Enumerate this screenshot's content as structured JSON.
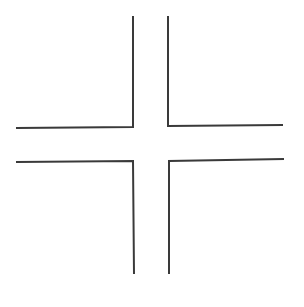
{
  "diagram": {
    "stroke_color": "#3a3a3a",
    "background": "#ffffff",
    "corners": [
      {
        "name": "top-left",
        "points": "133,16 133,127 16,128"
      },
      {
        "name": "top-right",
        "points": "168,16 168,126 283,125"
      },
      {
        "name": "bottom-left",
        "points": "16,162 133,161 134,274"
      },
      {
        "name": "bottom-right",
        "points": "284,159 169,161 169,274"
      }
    ]
  }
}
